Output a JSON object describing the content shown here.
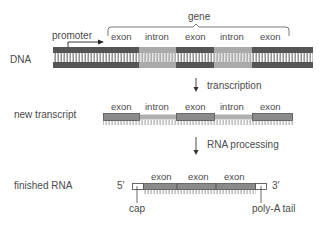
{
  "rows": {
    "dna": {
      "label": "DNA"
    },
    "transcript": {
      "label": "new transcript"
    },
    "finished": {
      "label": "finished RNA"
    }
  },
  "dna": {
    "promoter_label": "promoter",
    "gene_label": "gene",
    "segments": [
      "exon",
      "intron",
      "exon",
      "intron",
      "exon"
    ]
  },
  "transcript": {
    "segments": [
      "exon",
      "intron",
      "exon",
      "intron",
      "exon"
    ]
  },
  "finished": {
    "segments": [
      "exon",
      "exon",
      "exon"
    ],
    "five_prime": "5′",
    "three_prime": "3′",
    "cap_label": "cap",
    "polya_label": "poly-A tail"
  },
  "steps": {
    "transcription": "transcription",
    "processing": "RNA processing"
  },
  "colors": {
    "exon_dark": "#555555",
    "intron_light": "#aaaaaa",
    "rna_exon": "#8a8a8a",
    "rna_intron": "#b0b0b0",
    "text": "#4a4a4a"
  }
}
